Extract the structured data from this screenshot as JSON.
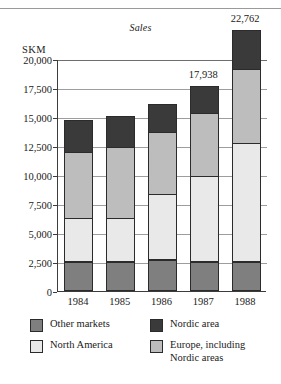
{
  "page": {
    "top_cutoff_text": "",
    "unit_label": "SKM"
  },
  "chart_data": {
    "type": "bar",
    "subtype": "stacked-bar",
    "title": "Sales",
    "xlabel": "",
    "ylabel": "SKM",
    "ylim": [
      0,
      20000
    ],
    "ytick_values": [
      0,
      2500,
      5000,
      7500,
      10000,
      12500,
      15000,
      17500,
      20000
    ],
    "ytick_labels": [
      "0",
      "2,500",
      "5,000",
      "7,500",
      "10,000",
      "12,500",
      "15,000",
      "17,500",
      "20,000"
    ],
    "grid": true,
    "legend_position": "bottom",
    "categories": [
      "1984",
      "1985",
      "1986",
      "1987",
      "1988"
    ],
    "series": [
      {
        "name": "Other markets",
        "color": "#7f7f7f",
        "values": [
          2500,
          2500,
          2700,
          2500,
          2500
        ]
      },
      {
        "name": "North America",
        "color": "#e9e9e9",
        "values": [
          3800,
          3800,
          5700,
          7400,
          10300
        ]
      },
      {
        "name": "Europe, including\nNordic areas",
        "color": "#bdbdbd",
        "values": [
          5800,
          6200,
          5400,
          5500,
          6400
        ]
      },
      {
        "name": "Nordic area",
        "color": "#3a3a3a",
        "values": [
          2800,
          2800,
          2500,
          2500,
          3500
        ]
      }
    ],
    "totals": [
      14900,
      15300,
      16300,
      17938,
      22762
    ],
    "annotations": [
      {
        "category": "1987",
        "text": "17,938"
      },
      {
        "category": "1988",
        "text": "22,762"
      }
    ]
  },
  "legend": {
    "items": [
      {
        "label": "Other markets",
        "color": "#7f7f7f"
      },
      {
        "label": "Nordic area",
        "color": "#3a3a3a"
      },
      {
        "label": "North America",
        "color": "#e9e9e9"
      },
      {
        "label": "Europe, including\nNordic areas",
        "color": "#bdbdbd"
      }
    ]
  }
}
